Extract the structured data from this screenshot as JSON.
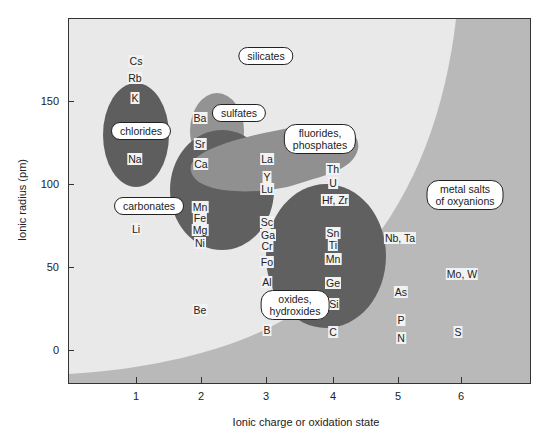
{
  "chart_data": {
    "type": "scatter",
    "title": "",
    "xlabel": "Ionic charge or oxidation state",
    "ylabel": "Ionic radius (pm)",
    "x_ticks": [
      "1",
      "2",
      "3",
      "4",
      "5",
      "6"
    ],
    "y_ticks": [
      "0",
      "50",
      "100",
      "150"
    ],
    "xlim": [
      0,
      7
    ],
    "ylim": [
      -20,
      200
    ],
    "colors": {
      "silicates_region": "#e9e9e9",
      "metal_salts_region": "#b9b9b9",
      "dark_regions": "#5f5f5f",
      "medium_regions": "#8f8f8f"
    },
    "regions": [
      {
        "name": "silicates",
        "label": "silicates"
      },
      {
        "name": "metal-salts",
        "label": "metal salts\nof oxyanions"
      },
      {
        "name": "chlorides",
        "label": "chlorides"
      },
      {
        "name": "sulfates",
        "label": "sulfates"
      },
      {
        "name": "carbonates",
        "label": "carbonates"
      },
      {
        "name": "fluorides-phosphates",
        "label": "fluorides,\nphosphates"
      },
      {
        "name": "oxides-hydroxides",
        "label": "oxides,\nhydroxides"
      }
    ],
    "points": [
      {
        "label": "Cs",
        "x": 1,
        "y": 167
      },
      {
        "label": "Rb",
        "x": 1,
        "y": 152
      },
      {
        "label": "K",
        "x": 1,
        "y": 138
      },
      {
        "label": "Na",
        "x": 1,
        "y": 102
      },
      {
        "label": "Li",
        "x": 1,
        "y": 76
      },
      {
        "label": "Ba",
        "x": 2,
        "y": 135
      },
      {
        "label": "Sr",
        "x": 2,
        "y": 118
      },
      {
        "label": "Ca",
        "x": 2,
        "y": 100
      },
      {
        "label": "Mn",
        "x": 2,
        "y": 83
      },
      {
        "label": "Fe",
        "x": 2,
        "y": 78
      },
      {
        "label": "Mg",
        "x": 2,
        "y": 72
      },
      {
        "label": "Ni",
        "x": 2,
        "y": 69
      },
      {
        "label": "Be",
        "x": 2,
        "y": 27
      },
      {
        "label": "La",
        "x": 3,
        "y": 103
      },
      {
        "label": "Y",
        "x": 3,
        "y": 90
      },
      {
        "label": "Lu",
        "x": 3,
        "y": 86
      },
      {
        "label": "Sc",
        "x": 3,
        "y": 75
      },
      {
        "label": "Ga",
        "x": 3,
        "y": 62
      },
      {
        "label": "Cr",
        "x": 3,
        "y": 62
      },
      {
        "label": "Fo",
        "x": 3,
        "y": 55
      },
      {
        "label": "Al",
        "x": 3,
        "y": 54
      },
      {
        "label": "B",
        "x": 3,
        "y": 12
      },
      {
        "label": "Th",
        "x": 4,
        "y": 94
      },
      {
        "label": "U",
        "x": 4,
        "y": 89
      },
      {
        "label": "Hf, Zr",
        "x": 4,
        "y": 72
      },
      {
        "label": "Sn",
        "x": 4,
        "y": 69
      },
      {
        "label": "Ti",
        "x": 4,
        "y": 61
      },
      {
        "label": "Mn",
        "x": 4,
        "y": 53
      },
      {
        "label": "Ge",
        "x": 4,
        "y": 53
      },
      {
        "label": "Si",
        "x": 4,
        "y": 40
      },
      {
        "label": "C",
        "x": 4,
        "y": 15
      },
      {
        "label": "Nb, Ta",
        "x": 5,
        "y": 64
      },
      {
        "label": "As",
        "x": 5,
        "y": 46
      },
      {
        "label": "P",
        "x": 5,
        "y": 38
      },
      {
        "label": "N",
        "x": 5,
        "y": 13
      },
      {
        "label": "Mo, W",
        "x": 6,
        "y": 59
      },
      {
        "label": "S",
        "x": 6,
        "y": 12
      }
    ]
  },
  "axes": {
    "xlabel": "Ionic charge or oxidation state",
    "ylabel": "Ionic radius (pm)",
    "x": [
      {
        "label": "1",
        "px": 136
      },
      {
        "label": "2",
        "px": 201
      },
      {
        "label": "3",
        "px": 266
      },
      {
        "label": "4",
        "px": 333
      },
      {
        "label": "5",
        "px": 398
      },
      {
        "label": "6",
        "px": 461
      }
    ],
    "y": [
      {
        "label": "150",
        "px": 101
      },
      {
        "label": "100",
        "px": 184
      },
      {
        "label": "50",
        "px": 267
      },
      {
        "label": "0",
        "px": 350
      }
    ]
  },
  "bubbles": {
    "silicates": "silicates",
    "sulfates": "sulfates",
    "chlorides": "chlorides",
    "carbonates": "carbonates",
    "fluorides": "fluorides,\nphosphates",
    "metal_salts": "metal salts\nof oxyanions",
    "oxides": "oxides,\nhydroxides"
  },
  "labels": [
    {
      "t": "Cs",
      "x": 135,
      "y": 60
    },
    {
      "t": "Rb",
      "x": 134,
      "y": 77
    },
    {
      "t": "K",
      "x": 134,
      "y": 97
    },
    {
      "t": "Na",
      "x": 134,
      "y": 158
    },
    {
      "t": "Li",
      "x": 135,
      "y": 228
    },
    {
      "t": "Ba",
      "x": 199,
      "y": 117
    },
    {
      "t": "Sr",
      "x": 199,
      "y": 143
    },
    {
      "t": "Ca",
      "x": 200,
      "y": 163
    },
    {
      "t": "Mn",
      "x": 199,
      "y": 206
    },
    {
      "t": "Fe",
      "x": 199,
      "y": 217
    },
    {
      "t": "Mg",
      "x": 199,
      "y": 229
    },
    {
      "t": "Ni",
      "x": 199,
      "y": 242
    },
    {
      "t": "Be",
      "x": 199,
      "y": 309
    },
    {
      "t": "La",
      "x": 266,
      "y": 158
    },
    {
      "t": "Y",
      "x": 266,
      "y": 176
    },
    {
      "t": "Lu",
      "x": 266,
      "y": 188
    },
    {
      "t": "Sc",
      "x": 266,
      "y": 221
    },
    {
      "t": "Ga",
      "x": 267,
      "y": 234
    },
    {
      "t": "Cr",
      "x": 266,
      "y": 245
    },
    {
      "t": "Fo",
      "x": 266,
      "y": 261
    },
    {
      "t": "Al",
      "x": 266,
      "y": 281
    },
    {
      "t": "B",
      "x": 266,
      "y": 329
    },
    {
      "t": "Th",
      "x": 332,
      "y": 168
    },
    {
      "t": "U",
      "x": 332,
      "y": 182
    },
    {
      "t": "Hf, Zr",
      "x": 334,
      "y": 199
    },
    {
      "t": "Sn",
      "x": 332,
      "y": 232
    },
    {
      "t": "Ti",
      "x": 332,
      "y": 244
    },
    {
      "t": "Mn",
      "x": 332,
      "y": 258
    },
    {
      "t": "Ge",
      "x": 332,
      "y": 282
    },
    {
      "t": "Si",
      "x": 333,
      "y": 303
    },
    {
      "t": "C",
      "x": 332,
      "y": 331
    },
    {
      "t": "Nb, Ta",
      "x": 399,
      "y": 237
    },
    {
      "t": "As",
      "x": 400,
      "y": 291
    },
    {
      "t": "P",
      "x": 400,
      "y": 319
    },
    {
      "t": "N",
      "x": 400,
      "y": 337
    },
    {
      "t": "Mo, W",
      "x": 461,
      "y": 273
    },
    {
      "t": "S",
      "x": 457,
      "y": 331
    }
  ]
}
